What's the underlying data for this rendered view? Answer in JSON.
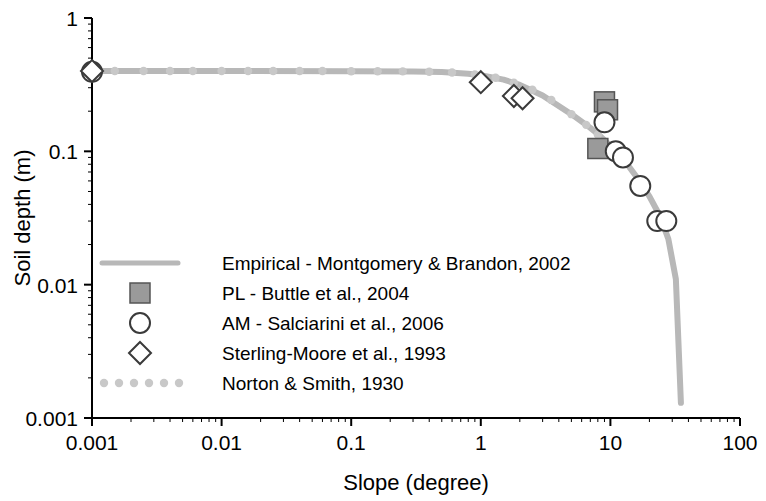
{
  "chart_data": {
    "type": "scatter",
    "title": "",
    "xlabel": "Slope (degree)",
    "ylabel": "Soil depth (m)",
    "xscale": "log",
    "yscale": "log",
    "xlim": [
      0.001,
      100
    ],
    "ylim": [
      0.001,
      1
    ],
    "xticks": [
      "0.001",
      "0.01",
      "0.1",
      "1",
      "10",
      "100"
    ],
    "yticks": [
      "0.001",
      "0.01",
      "0.1",
      "1"
    ],
    "grid": false,
    "legend_position": "inside-lower-left",
    "series": [
      {
        "name": "Empirical - Montgomery & Brandon, 2002",
        "type": "line",
        "color": "#b8b8b8",
        "marker": "none",
        "points": [
          [
            0.001,
            0.4
          ],
          [
            0.01,
            0.4
          ],
          [
            0.1,
            0.399
          ],
          [
            0.3,
            0.397
          ],
          [
            0.5,
            0.393
          ],
          [
            0.8,
            0.382
          ],
          [
            1.0,
            0.372
          ],
          [
            1.5,
            0.345
          ],
          [
            2.0,
            0.315
          ],
          [
            3.0,
            0.262
          ],
          [
            5.0,
            0.19
          ],
          [
            7.0,
            0.15
          ],
          [
            8.0,
            0.135
          ],
          [
            10.0,
            0.11
          ],
          [
            13.0,
            0.084
          ],
          [
            16.0,
            0.064
          ],
          [
            20.0,
            0.046
          ],
          [
            24.0,
            0.033
          ],
          [
            28.0,
            0.022
          ],
          [
            32.0,
            0.011
          ],
          [
            35.0,
            0.0013
          ]
        ]
      },
      {
        "name": "PL - Buttle et al., 2004",
        "type": "scatter",
        "color": "#9a9a9a",
        "marker": "square",
        "points": [
          [
            8.0,
            0.105
          ],
          [
            9.0,
            0.235
          ],
          [
            9.5,
            0.205
          ]
        ]
      },
      {
        "name": "AM - Salciarini et al., 2006",
        "type": "scatter",
        "color": "#ffffff",
        "marker": "circle",
        "points": [
          [
            0.001,
            0.395
          ],
          [
            9.0,
            0.165
          ],
          [
            11.0,
            0.1
          ],
          [
            12.5,
            0.09
          ],
          [
            17.0,
            0.055
          ],
          [
            23.0,
            0.03
          ],
          [
            27.0,
            0.03
          ]
        ]
      },
      {
        "name": "Sterling-Moore et al., 1993",
        "type": "scatter",
        "color": "#ffffff",
        "marker": "diamond",
        "points": [
          [
            0.001,
            0.4
          ],
          [
            1.0,
            0.33
          ],
          [
            1.8,
            0.26
          ],
          [
            2.1,
            0.25
          ]
        ]
      },
      {
        "name": "Norton & Smith, 1930",
        "type": "scatter",
        "color": "#c8c8c8",
        "marker": "dotted-line",
        "points": [
          [
            0.0015,
            0.4
          ],
          [
            0.0025,
            0.4
          ],
          [
            0.004,
            0.4
          ],
          [
            0.006,
            0.4
          ],
          [
            0.01,
            0.4
          ],
          [
            0.016,
            0.4
          ],
          [
            0.025,
            0.4
          ],
          [
            0.04,
            0.4
          ],
          [
            0.06,
            0.4
          ],
          [
            0.1,
            0.399
          ],
          [
            0.16,
            0.399
          ],
          [
            0.25,
            0.398
          ],
          [
            0.4,
            0.395
          ],
          [
            0.6,
            0.39
          ],
          [
            0.9,
            0.377
          ],
          [
            1.3,
            0.356
          ],
          [
            1.8,
            0.327
          ],
          [
            2.5,
            0.29
          ],
          [
            3.5,
            0.243
          ],
          [
            5.0,
            0.19
          ],
          [
            6.5,
            0.158
          ],
          [
            8.0,
            0.133
          ]
        ]
      }
    ],
    "legend_entries": [
      {
        "label": "Empirical - Montgomery & Brandon, 2002",
        "marker": "line",
        "color": "#b8b8b8"
      },
      {
        "label": "PL - Buttle et al., 2004",
        "marker": "square",
        "color": "#9a9a9a"
      },
      {
        "label": "AM - Salciarini et al., 2006",
        "marker": "circle",
        "color": "#ffffff"
      },
      {
        "label": "Sterling-Moore et al., 1993",
        "marker": "diamond",
        "color": "#ffffff"
      },
      {
        "label": "Norton & Smith, 1930",
        "marker": "dotted",
        "color": "#c8c8c8"
      }
    ]
  }
}
